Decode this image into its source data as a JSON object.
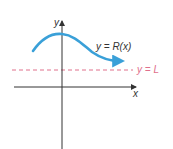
{
  "diagram": {
    "axes": {
      "x_label": "x",
      "y_label": "y"
    },
    "curve": {
      "label": "y = R(x)",
      "color": "#3aa0d8"
    },
    "asymptote": {
      "label": "y = L",
      "color": "#e0708c"
    },
    "axis_color": "#333333"
  }
}
